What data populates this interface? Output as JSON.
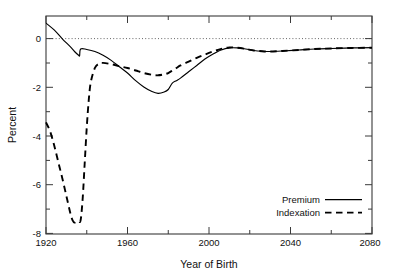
{
  "chart_data": {
    "type": "line",
    "title": "",
    "xlabel": "Year of Birth",
    "ylabel": "Percent",
    "xlim": [
      1920,
      2080
    ],
    "ylim": [
      -8,
      0.6
    ],
    "grid": false,
    "zero_reference_line": true,
    "legend_position": "lower-right-inset",
    "xticks_major": [
      1920,
      1960,
      2000,
      2040,
      2080
    ],
    "xticks_minor": [
      1940,
      1980,
      2020,
      2060
    ],
    "xtick_labels": [
      "1920",
      "1960",
      "2000",
      "2040",
      "2080"
    ],
    "yticks_major": [
      0,
      -2,
      -4,
      -6,
      -8
    ],
    "yticks_minor": [
      -1,
      -3,
      -5,
      -7
    ],
    "ytick_labels": [
      "0",
      "-2",
      "-4",
      "-6",
      "-8"
    ],
    "series": [
      {
        "name": "Premium",
        "style": "solid",
        "color": "#000000",
        "x": [
          1920,
          1924,
          1928,
          1932,
          1934,
          1936,
          1936.5,
          1937,
          1940,
          1944,
          1948,
          1952,
          1956,
          1960,
          1964,
          1968,
          1972,
          1975,
          1978,
          1980,
          1982,
          1984,
          1986,
          1990,
          1994,
          1998,
          2002,
          2006,
          2010,
          2014,
          2018,
          2022,
          2026,
          2030,
          2036,
          2044,
          2052,
          2060,
          2070,
          2080
        ],
        "y": [
          0.32,
          0.05,
          -0.3,
          -0.62,
          -0.8,
          -0.95,
          -0.96,
          -0.7,
          -0.72,
          -0.8,
          -0.95,
          -1.15,
          -1.4,
          -1.65,
          -1.95,
          -2.2,
          -2.38,
          -2.45,
          -2.4,
          -2.3,
          -2.05,
          -1.95,
          -1.85,
          -1.6,
          -1.35,
          -1.1,
          -0.9,
          -0.74,
          -0.66,
          -0.66,
          -0.7,
          -0.76,
          -0.79,
          -0.8,
          -0.78,
          -0.74,
          -0.7,
          -0.68,
          -0.66,
          -0.65
        ]
      },
      {
        "name": "Indexation",
        "style": "dashed",
        "color": "#000000",
        "x": [
          1920,
          1922,
          1924,
          1926,
          1928,
          1930,
          1932,
          1933,
          1934,
          1935,
          1936,
          1937,
          1938,
          1939,
          1940,
          1941,
          1942,
          1944,
          1946,
          1948,
          1952,
          1956,
          1960,
          1964,
          1968,
          1972,
          1975,
          1978,
          1980,
          1982,
          1984,
          1986,
          1990,
          1994,
          1998,
          2002,
          2006,
          2010,
          2014,
          2018,
          2022,
          2026,
          2030,
          2036,
          2044,
          2052,
          2060,
          2070,
          2080
        ],
        "y": [
          -3.6,
          -3.95,
          -4.5,
          -5.15,
          -5.8,
          -6.5,
          -7.2,
          -7.45,
          -7.55,
          -7.5,
          -7.5,
          -7.45,
          -6.6,
          -5.2,
          -3.8,
          -2.7,
          -2.0,
          -1.45,
          -1.28,
          -1.25,
          -1.3,
          -1.38,
          -1.45,
          -1.55,
          -1.65,
          -1.72,
          -1.74,
          -1.7,
          -1.65,
          -1.55,
          -1.45,
          -1.35,
          -1.2,
          -1.05,
          -0.92,
          -0.8,
          -0.7,
          -0.64,
          -0.65,
          -0.7,
          -0.76,
          -0.79,
          -0.8,
          -0.78,
          -0.74,
          -0.7,
          -0.68,
          -0.66,
          -0.65
        ]
      }
    ],
    "legend": [
      {
        "label": "Premium",
        "style": "solid"
      },
      {
        "label": "Indexation",
        "style": "dashed"
      }
    ]
  }
}
